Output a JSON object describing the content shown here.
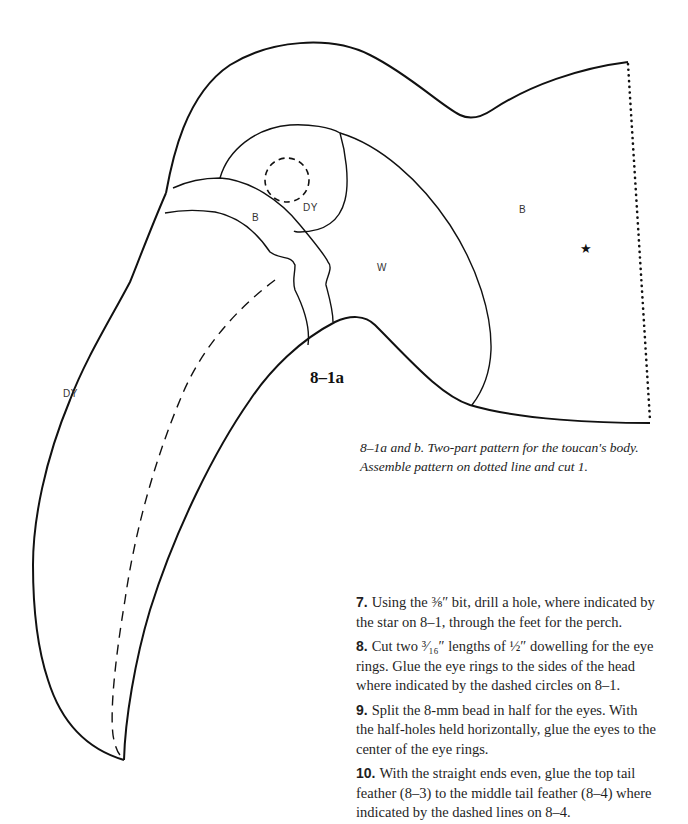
{
  "figure": {
    "label": "8–1a",
    "star_symbol": "★",
    "regions": [
      {
        "id": "beak-upper",
        "label": "DY"
      },
      {
        "id": "beak-band",
        "label": "B"
      },
      {
        "id": "eye-patch",
        "label": "DY"
      },
      {
        "id": "face",
        "label": "W"
      },
      {
        "id": "body",
        "label": "B"
      }
    ],
    "caption": "8–1a and b.  Two-part pattern for the toucan's body. Assemble pattern on dotted line and cut 1."
  },
  "steps": [
    {
      "number": "7.",
      "text": "Using the ⅜″ bit, drill a hole, where indicated by the star on 8–1, through the feet for the perch."
    },
    {
      "number": "8.",
      "text": "Cut two ³⁄₁₆″ lengths of ½″ dowelling for the eye rings. Glue the eye rings to the sides of the head where indicated by the dashed circles on 8–1."
    },
    {
      "number": "9.",
      "text": "Split the 8-mm bead in half for the eyes. With the half-holes held horizontally, glue the eyes to the center of the eye rings."
    },
    {
      "number": "10.",
      "text": "With the straight ends even, glue the top tail feather (8–3) to the middle tail feather (8–4) where indicated by the dashed lines on 8–4."
    }
  ]
}
